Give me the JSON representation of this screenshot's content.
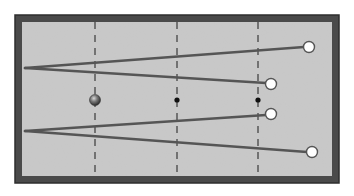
{
  "diagram": {
    "title": "Billiard table practice drill",
    "colors": {
      "background": "#ffffff",
      "cushion": "#4a4a4a",
      "cushion_edge": "#2e2e2e",
      "felt": "#c9c9c9",
      "guide_line": "#3a3a3a",
      "shot_line": "#555555",
      "object_ball_fill": "#ffffff",
      "object_ball_stroke": "#555555",
      "cue_ball_fill": "#6b6b6b",
      "spot": "#111111"
    },
    "guide_lines": [
      {
        "id": "line-1",
        "position": "first-quarter"
      },
      {
        "id": "line-2",
        "position": "center"
      },
      {
        "id": "line-3",
        "position": "third-quarter"
      }
    ],
    "spots": [
      {
        "id": "center-spot",
        "on": "line-2"
      },
      {
        "id": "right-spot",
        "on": "line-3"
      }
    ],
    "cue_ball": {
      "id": "dark-ball",
      "on": "line-1"
    },
    "object_balls": [
      {
        "id": "ball-top-far"
      },
      {
        "id": "ball-top-near"
      },
      {
        "id": "ball-bottom-near"
      },
      {
        "id": "ball-bottom-far"
      }
    ],
    "shot_paths": [
      {
        "id": "upper-path-to-far",
        "from": "upper-origin",
        "to": "ball-top-far"
      },
      {
        "id": "upper-path-to-near",
        "from": "upper-origin",
        "to": "ball-top-near"
      },
      {
        "id": "lower-path-to-near",
        "from": "lower-origin",
        "to": "ball-bottom-near"
      },
      {
        "id": "lower-path-to-far",
        "from": "lower-origin",
        "to": "ball-bottom-far"
      }
    ]
  }
}
